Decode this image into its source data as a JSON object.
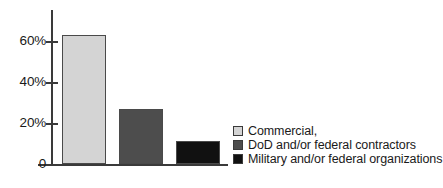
{
  "chart_data": {
    "type": "bar",
    "title": "",
    "subtitle": "",
    "xlabel": "",
    "ylabel": "",
    "grid": false,
    "legend_position": "right-inside",
    "ylim": [
      0,
      70
    ],
    "yticks": [
      {
        "value": 0,
        "label": "0"
      },
      {
        "value": 20,
        "label": "20%"
      },
      {
        "value": 40,
        "label": "40%"
      },
      {
        "value": 60,
        "label": "60%"
      }
    ],
    "categories": [
      "Commercial,",
      "DoD and/or federal contractors",
      "Military and/or federal organizations"
    ],
    "values": [
      63,
      27,
      11
    ],
    "colors": [
      "#d4d4d4",
      "#4d4d4d",
      "#111111"
    ],
    "bar_edge_color": "#4a4a4a",
    "axis_color": "#3a3a3a",
    "text_color": "#1a1a1a",
    "background": "#ffffff"
  },
  "legend": {
    "items": [
      {
        "label": "Commercial,",
        "color": "#d4d4d4"
      },
      {
        "label": "DoD and/or federal contractors",
        "color": "#4d4d4d"
      },
      {
        "label": "Military and/or federal organizations",
        "color": "#111111"
      }
    ]
  }
}
